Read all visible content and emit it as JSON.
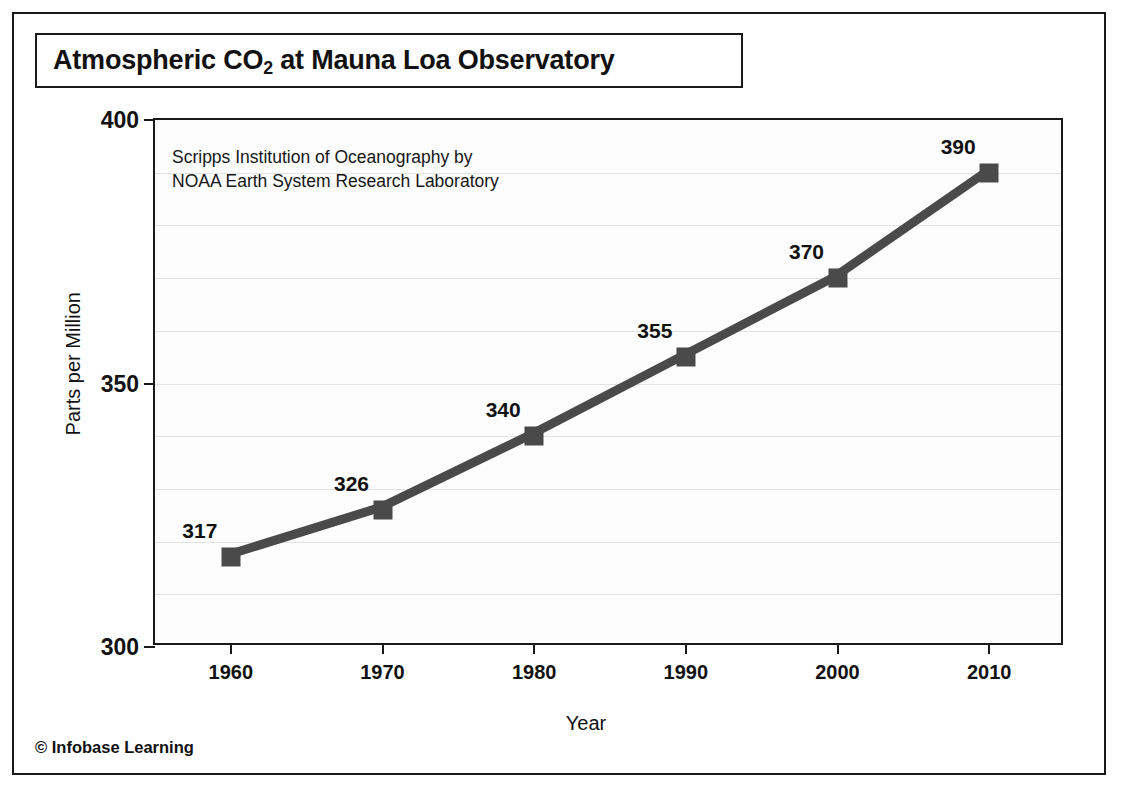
{
  "figure": {
    "title_main": "Atmospheric CO",
    "title_sub": "2",
    "title_tail": " at Mauna Loa Observatory",
    "credit": "© Infobase Learning",
    "frame_color": "#1a1a1a",
    "background": "#ffffff"
  },
  "chart_data": {
    "type": "line",
    "title": "Atmospheric CO2 at Mauna Loa Observatory",
    "subtitle": "Scripps Institution of Oceanography by\nNOAA Earth System Research Laboratory",
    "xlabel": "Year",
    "ylabel": "Parts per Million",
    "x": [
      1960,
      1970,
      1980,
      1990,
      2000,
      2010
    ],
    "values": [
      317,
      326,
      340,
      355,
      370,
      390
    ],
    "point_labels": [
      "317",
      "326",
      "340",
      "355",
      "370",
      "390"
    ],
    "xtick_labels": [
      "1960",
      "1970",
      "1980",
      "1990",
      "2000",
      "2010"
    ],
    "ytick_labels": [
      "300",
      "350",
      "400"
    ],
    "yticks": [
      300,
      350,
      400
    ],
    "xlim": [
      1955,
      2015
    ],
    "ylim": [
      300,
      400
    ],
    "grid": true,
    "grid_interval": 10,
    "gridlines": [
      310,
      320,
      330,
      340,
      350,
      360,
      370,
      380,
      390
    ],
    "legend": "none",
    "series_color": "#4a4a4a",
    "marker": "square",
    "line_width": 9
  }
}
